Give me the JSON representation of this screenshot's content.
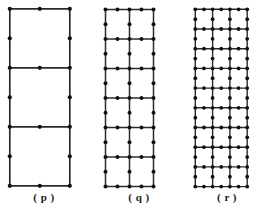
{
  "plate": {
    "title": "Lattice figures p, q, r",
    "background_color": "#ffffff",
    "line_color": "#2b2b2b",
    "node_color": "#111111"
  },
  "figures": [
    {
      "id": "p",
      "caption": "( p )",
      "columns": 1,
      "rows": 3,
      "origin_x": 10,
      "origin_y": 9,
      "cell_width": 60,
      "cell_height": 59,
      "node_radius": 2.1,
      "edge_width": 1.7,
      "caption_x": 0,
      "caption_y": 191,
      "caption_width": 88,
      "nodes_per_cell_edge": 2,
      "total_grid_columns": 2,
      "total_grid_rows": 6,
      "description": "1 column by 3 rows of square cells with nodes at corners and edge midpoints"
    },
    {
      "id": "q",
      "caption": "( q )",
      "columns": 2,
      "rows": 6,
      "origin_x": 105,
      "origin_y": 9,
      "cell_width": 24,
      "cell_height": 29.5,
      "node_radius": 2.0,
      "edge_width": 1.5,
      "caption_x": 95,
      "caption_y": 191,
      "caption_width": 88,
      "nodes_per_cell_edge": 2,
      "total_grid_columns": 4,
      "total_grid_rows": 12,
      "description": "2 columns by 6 rows of cells with nodes at corners and edge midpoints"
    },
    {
      "id": "r",
      "caption": "( r )",
      "columns": 3,
      "rows": 9,
      "origin_x": 195,
      "origin_y": 9,
      "cell_width": 17.3,
      "cell_height": 19.7,
      "node_radius": 1.9,
      "edge_width": 1.4,
      "caption_x": 185,
      "caption_y": 191,
      "caption_width": 84,
      "nodes_per_cell_edge": 2,
      "total_grid_columns": 6,
      "total_grid_rows": 18,
      "description": "3 columns by 9 rows of cells with nodes at corners and edge midpoints"
    }
  ]
}
